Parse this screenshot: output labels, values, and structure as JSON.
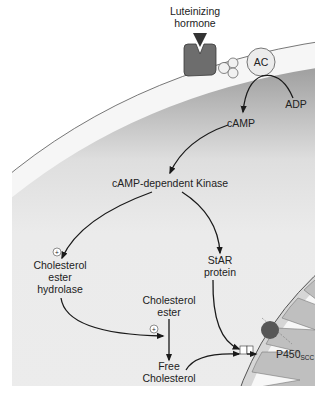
{
  "diagram": {
    "type": "signaling-pathway",
    "labels": {
      "hormone_line1": "Luteinizing",
      "hormone_line2": "hormone",
      "ac": "AC",
      "adp": "ADP",
      "camp": "cAMP",
      "kinase": "cAMP-dependent Kinase",
      "ceh_line1": "Cholesterol",
      "ceh_line2": "ester",
      "ceh_line3": "hydrolase",
      "star_line1": "StAR",
      "star_line2": "protein",
      "ce_line1": "Cholesterol",
      "ce_line2": "ester",
      "fc_line1": "Free",
      "fc_line2": "Cholesterol",
      "p450": "P450",
      "p450_sub": "SCC",
      "plus": "+"
    },
    "colors": {
      "receptor": "#6d6d6d",
      "membrane": "#f4f4f4",
      "cytoplasm": "#e9e9e9",
      "cytoplasm_dark": "#a8a8a8",
      "mito_inner": "#bdbdbd",
      "p450_dot": "#555555",
      "arrow": "#1a1a1a"
    }
  }
}
